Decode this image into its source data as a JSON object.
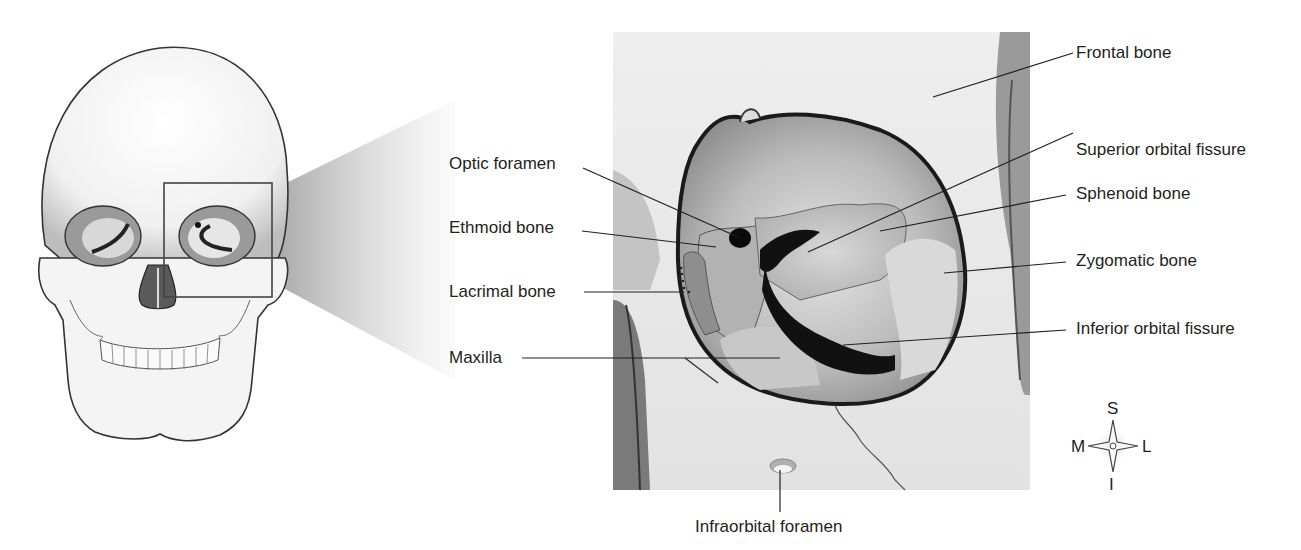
{
  "figure": {
    "inset_region": "orbit of skull"
  },
  "labels_left": [
    {
      "id": "optic-foramen",
      "text": "Optic foramen"
    },
    {
      "id": "ethmoid-bone",
      "text": "Ethmoid bone"
    },
    {
      "id": "lacrimal-bone",
      "text": "Lacrimal bone"
    },
    {
      "id": "maxilla",
      "text": "Maxilla"
    }
  ],
  "labels_right": [
    {
      "id": "frontal-bone",
      "text": "Frontal bone"
    },
    {
      "id": "superior-orbital-fissure",
      "text": "Superior orbital fissure"
    },
    {
      "id": "sphenoid-bone",
      "text": "Sphenoid bone"
    },
    {
      "id": "zygomatic-bone",
      "text": "Zygomatic bone"
    },
    {
      "id": "inferior-orbital-fissure",
      "text": "Inferior orbital fissure"
    }
  ],
  "labels_bottom": [
    {
      "id": "infraorbital-foramen",
      "text": "Infraorbital foramen"
    }
  ],
  "compass": {
    "superior": "S",
    "inferior": "I",
    "medial": "M",
    "lateral": "L"
  }
}
